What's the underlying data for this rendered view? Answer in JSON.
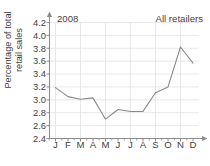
{
  "figure": {
    "clipped_top_title": "",
    "year_label": "2008",
    "series_label": "All retailers",
    "ylabel_line1": "Percentage of total",
    "ylabel_line2": "retail sales",
    "line_color": "#8a8a8a",
    "grid_color": "#e2e2e2",
    "axis_color": "#8c8c8c",
    "text_color": "#3f3f3f"
  },
  "chart_data": {
    "type": "line",
    "title": "",
    "subtitle": "2008",
    "xlabel": "",
    "ylabel": "Percentage of total retail sales",
    "categories": [
      "J",
      "F",
      "M",
      "A",
      "M",
      "J",
      "J",
      "A",
      "S",
      "O",
      "N",
      "D"
    ],
    "month_names": [
      "January",
      "February",
      "March",
      "April",
      "May",
      "June",
      "July",
      "August",
      "September",
      "October",
      "November",
      "December"
    ],
    "series": [
      {
        "name": "All retailers",
        "values": [
          3.19,
          3.05,
          3.01,
          3.03,
          2.7,
          2.85,
          2.82,
          2.82,
          3.11,
          3.2,
          3.82,
          3.57
        ]
      }
    ],
    "ylim": [
      2.4,
      4.2
    ],
    "yticks": [
      2.4,
      2.6,
      2.8,
      3.0,
      3.2,
      3.4,
      3.6,
      3.8,
      4.0,
      4.2
    ],
    "ytick_labels": [
      "2.4",
      "2.6",
      "2.8",
      "3.0",
      "3.2",
      "3.4",
      "3.6",
      "3.8",
      "4.0",
      "4.2"
    ],
    "grid": true,
    "legend": "none"
  }
}
